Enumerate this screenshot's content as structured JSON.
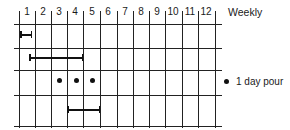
{
  "diagram": {
    "title": "Weekly",
    "columns": [
      "1",
      "2",
      "3",
      "4",
      "5",
      "6",
      "7",
      "8",
      "9",
      "10",
      "11",
      "12"
    ],
    "legend": {
      "symbol": "dot",
      "label": "1 day pour"
    },
    "rows": [
      {
        "type": "bar",
        "start_week": 1,
        "end_week": 1.5
      },
      {
        "type": "bar",
        "start_week": 1.5,
        "end_week": 4
      },
      {
        "type": "dots",
        "weeks": [
          3,
          4,
          5
        ]
      },
      {
        "type": "bar",
        "start_week": 4,
        "end_week": 5
      }
    ]
  }
}
